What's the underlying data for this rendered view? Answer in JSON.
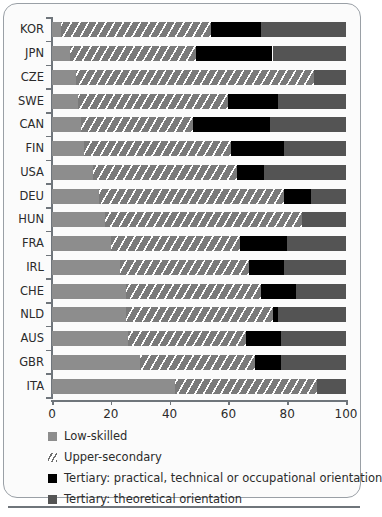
{
  "chart_data": {
    "type": "bar",
    "orientation": "horizontal",
    "stacked": true,
    "title": "",
    "subtitle": "",
    "xlabel": "",
    "ylabel": "",
    "xlim": [
      0,
      100
    ],
    "xticks": [
      0,
      20,
      40,
      60,
      80,
      100
    ],
    "xtick_labels": [
      "0",
      "20",
      "40",
      "60",
      "80",
      "100"
    ],
    "grid": false,
    "legend_position": "below-axis",
    "categories": [
      "KOR",
      "JPN",
      "CZE",
      "SWE",
      "CAN",
      "FIN",
      "USA",
      "DEU",
      "HUN",
      "FRA",
      "IRL",
      "CHE",
      "NLD",
      "AUS",
      "GBR",
      "ITA"
    ],
    "series": [
      {
        "name": "Low-skilled",
        "color": "#8d8d8d",
        "values": [
          3,
          6,
          8,
          9,
          10,
          11,
          14,
          16,
          18,
          20,
          23,
          25,
          25,
          26,
          30,
          42
        ]
      },
      {
        "name": "Upper-secondary",
        "color": "#7a7a7a",
        "pattern": "diagonal-hatch",
        "values": [
          51,
          43,
          81,
          51,
          38,
          50,
          49,
          63,
          67,
          44,
          44,
          46,
          50,
          40,
          39,
          48
        ]
      },
      {
        "name": "Tertiary: practical, technical or occupational orientation",
        "color": "#000000",
        "values": [
          17,
          26,
          0,
          17,
          26,
          18,
          9,
          9,
          0,
          16,
          12,
          12,
          2,
          12,
          9,
          0
        ]
      },
      {
        "name": "Tertiary: theoretical orientation",
        "color": "#545454",
        "values": [
          29,
          25,
          11,
          23,
          26,
          21,
          28,
          12,
          15,
          20,
          21,
          17,
          23,
          22,
          22,
          10
        ]
      }
    ],
    "legend_entries": [
      "Low-skilled",
      "Upper-secondary",
      "Tertiary: practical, technical or occupational orientation",
      "Tertiary: theoretical orientation"
    ]
  }
}
